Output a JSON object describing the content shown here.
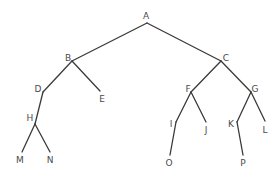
{
  "diagram": {
    "type": "binary-tree",
    "nodes": [
      {
        "id": "A",
        "label": "A",
        "x": 147,
        "y": 23,
        "lx": 146,
        "ly": 19
      },
      {
        "id": "B",
        "label": "B",
        "x": 72,
        "y": 61,
        "lx": 68,
        "ly": 61
      },
      {
        "id": "C",
        "label": "C",
        "x": 221,
        "y": 61,
        "lx": 226,
        "ly": 61
      },
      {
        "id": "D",
        "label": "D",
        "x": 43,
        "y": 92,
        "lx": 38,
        "ly": 92
      },
      {
        "id": "E",
        "label": "E",
        "x": 100,
        "y": 91,
        "lx": 102,
        "ly": 102
      },
      {
        "id": "F",
        "label": "F",
        "x": 191,
        "y": 92,
        "lx": 188,
        "ly": 92
      },
      {
        "id": "G",
        "label": "G",
        "x": 251,
        "y": 92,
        "lx": 255,
        "ly": 92
      },
      {
        "id": "H",
        "label": "H",
        "x": 35,
        "y": 124,
        "lx": 30,
        "ly": 121
      },
      {
        "id": "I",
        "label": "I",
        "x": 176,
        "y": 122,
        "lx": 171,
        "ly": 127
      },
      {
        "id": "J",
        "label": "J",
        "x": 206,
        "y": 122,
        "lx": 206,
        "ly": 133
      },
      {
        "id": "K",
        "label": "K",
        "x": 237,
        "y": 122,
        "lx": 231,
        "ly": 127
      },
      {
        "id": "L",
        "label": "L",
        "x": 265,
        "y": 121,
        "lx": 265,
        "ly": 133
      },
      {
        "id": "M",
        "label": "M",
        "x": 22,
        "y": 152,
        "lx": 20,
        "ly": 163
      },
      {
        "id": "N",
        "label": "N",
        "x": 50,
        "y": 152,
        "lx": 50,
        "ly": 163
      },
      {
        "id": "O",
        "label": "O",
        "x": 170,
        "y": 155,
        "lx": 169,
        "ly": 166
      },
      {
        "id": "P",
        "label": "P",
        "x": 243,
        "y": 155,
        "lx": 243,
        "ly": 166
      }
    ],
    "edges": [
      [
        "A",
        "B"
      ],
      [
        "A",
        "C"
      ],
      [
        "B",
        "D"
      ],
      [
        "B",
        "E"
      ],
      [
        "C",
        "F"
      ],
      [
        "C",
        "G"
      ],
      [
        "D",
        "H"
      ],
      [
        "H",
        "M"
      ],
      [
        "H",
        "N"
      ],
      [
        "F",
        "I"
      ],
      [
        "F",
        "J"
      ],
      [
        "I",
        "O"
      ],
      [
        "G",
        "K"
      ],
      [
        "G",
        "L"
      ],
      [
        "K",
        "P"
      ]
    ],
    "colors": {
      "edge": "#3a3a3a",
      "label": "#4a4a4a",
      "background": "#ffffff"
    }
  }
}
